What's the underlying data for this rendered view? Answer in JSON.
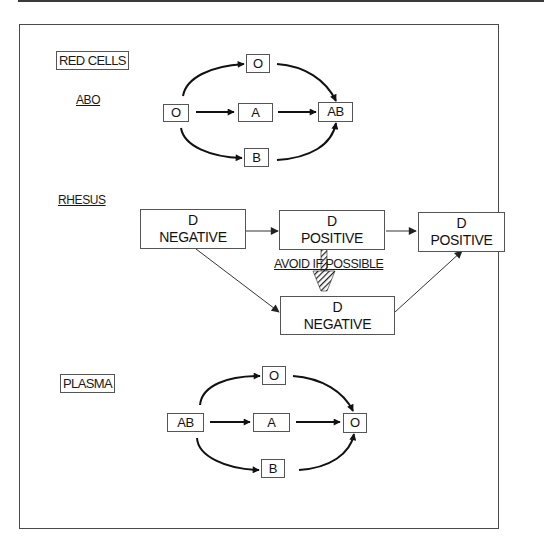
{
  "figure": {
    "sections": {
      "red_cells": {
        "title": "RED CELLS",
        "abo": {
          "label": "ABO",
          "nodes": {
            "source": "O",
            "top": "O",
            "middle": "A",
            "bottom": "B",
            "target": "AB"
          },
          "edges": [
            [
              "O",
              "O (top)"
            ],
            [
              "O",
              "A"
            ],
            [
              "O",
              "B"
            ],
            [
              "O (top)",
              "AB"
            ],
            [
              "A",
              "AB"
            ],
            [
              "B",
              "AB"
            ]
          ]
        },
        "rhesus": {
          "label": "RHESUS",
          "nodes": {
            "d_negative_left": {
              "line1": "D",
              "line2": "NEGATIVE"
            },
            "d_positive_mid": {
              "line1": "D",
              "line2": "POSITIVE"
            },
            "d_positive_right": {
              "line1": "D",
              "line2": "POSITIVE"
            },
            "d_negative_bottom": {
              "line1": "D",
              "line2": "NEGATIVE"
            }
          },
          "annotation": "AVOID IF POSSIBLE",
          "edges": [
            [
              "D NEGATIVE",
              "D POSITIVE"
            ],
            [
              "D POSITIVE",
              "D POSITIVE (right)"
            ],
            [
              "D NEGATIVE",
              "D NEGATIVE (bottom)"
            ],
            [
              "D NEGATIVE (bottom)",
              "D POSITIVE (right)"
            ],
            [
              "D POSITIVE",
              "D NEGATIVE (bottom)",
              "hatched — avoid if possible"
            ]
          ]
        }
      },
      "plasma": {
        "title": "PLASMA",
        "nodes": {
          "source": "AB",
          "top": "O",
          "middle": "A",
          "bottom": "B",
          "target": "O"
        },
        "edges": [
          [
            "AB",
            "O (top)"
          ],
          [
            "AB",
            "A"
          ],
          [
            "AB",
            "B"
          ],
          [
            "O (top)",
            "O"
          ],
          [
            "A",
            "O"
          ],
          [
            "B",
            "O"
          ]
        ]
      }
    },
    "colors": {
      "ink": "#1a1a1a",
      "border": "#555555",
      "background": "#ffffff"
    }
  }
}
